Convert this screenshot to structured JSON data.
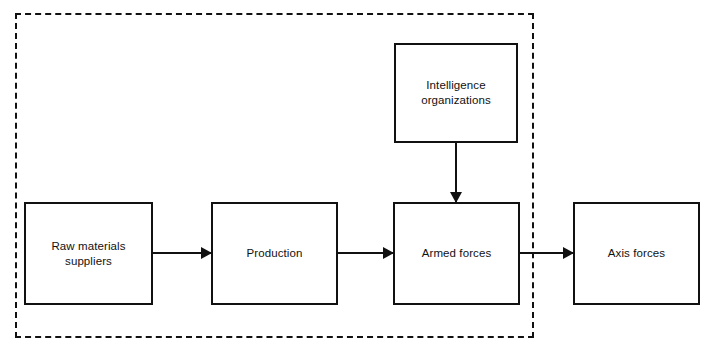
{
  "diagram": {
    "background_color": "#ffffff",
    "stroke_color": "#111111",
    "boundary": {
      "label": "system-boundary",
      "style": "dashed",
      "x": 15,
      "y": 13,
      "width": 519,
      "height": 325
    },
    "nodes": [
      {
        "id": "raw-materials-suppliers",
        "label": "Raw materials\nsuppliers",
        "x": 24,
        "y": 202,
        "width": 129,
        "height": 103,
        "inside_boundary": true
      },
      {
        "id": "production",
        "label": "Production",
        "x": 211,
        "y": 202,
        "width": 127,
        "height": 103,
        "inside_boundary": true
      },
      {
        "id": "armed-forces",
        "label": "Armed forces",
        "x": 393,
        "y": 202,
        "width": 127,
        "height": 103,
        "inside_boundary": true
      },
      {
        "id": "axis-forces",
        "label": "Axis forces",
        "x": 573,
        "y": 202,
        "width": 127,
        "height": 103,
        "inside_boundary": false
      },
      {
        "id": "intelligence-organizations",
        "label": "Intelligence\norganizations",
        "x": 394,
        "y": 43,
        "width": 124,
        "height": 100,
        "inside_boundary": true
      }
    ],
    "connectors": [
      {
        "id": "raw-materials-to-production",
        "from": "raw-materials-suppliers",
        "to": "production",
        "direction": "right",
        "x": 153,
        "y": 252,
        "length": 58
      },
      {
        "id": "production-to-armed-forces",
        "from": "production",
        "to": "armed-forces",
        "direction": "right",
        "x": 338,
        "y": 252,
        "length": 55
      },
      {
        "id": "armed-forces-to-axis-forces",
        "from": "armed-forces",
        "to": "axis-forces",
        "direction": "right",
        "x": 520,
        "y": 252,
        "length": 53
      },
      {
        "id": "intelligence-to-armed-forces",
        "from": "intelligence-organizations",
        "to": "armed-forces",
        "direction": "down",
        "x": 455,
        "y": 143,
        "length": 59
      }
    ]
  }
}
